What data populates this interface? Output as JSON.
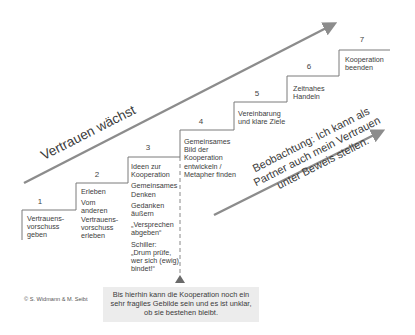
{
  "diagram": {
    "main_arrow": {
      "label": "Vertrauen wächst",
      "from": [
        24,
        183
      ],
      "to": [
        338,
        22
      ],
      "color": "#8c8c8c"
    },
    "observation_arrow": {
      "lines": [
        "Beobachtung: Ich kann als",
        "Partner auch mein Vertrauen",
        "unter Beweis stellen."
      ],
      "from": [
        214,
        215
      ],
      "to": [
        386,
        129
      ],
      "color": "#8c8c8c"
    },
    "steps": [
      {
        "number": "1",
        "items": [
          "Vertrauens-\nvorschuss\ngeben"
        ]
      },
      {
        "number": "2",
        "items": [
          "Erleben",
          "Vom\nanderen\nVertrauens-\nvorschuss\nerleben"
        ]
      },
      {
        "number": "3",
        "items": [
          "Ideen zur\nKooperation",
          "Gemeinsames\nDenken",
          "Gedanken\näußern",
          "„Versprechen\nabgeben“",
          "Schiller:\n„Drum prüfe,\nwer sich (ewig)\nbindet!“"
        ]
      },
      {
        "number": "4",
        "items": [
          "Gemeinsames\nBild der\nKooperation\nentwickeln /\nMetapher finden"
        ]
      },
      {
        "number": "5",
        "items": [
          "Vereinbarung\nund klare Ziele"
        ]
      },
      {
        "number": "6",
        "items": [
          "Zeitnahes\nHandeln"
        ]
      },
      {
        "number": "7",
        "items": [
          "Kooperation\nbeenden"
        ]
      }
    ],
    "note": "Bis hierhin kann die Kooperation noch ein sehr fragiles Gebilde sein und es ist unklar, ob sie bestehen bleibt.",
    "note_lines": [
      "Bis hierhin kann die Kooperation noch ein",
      "sehr fragiles Gebilde sein und es ist unklar,",
      "ob sie bestehen bleibt."
    ],
    "copyright": "© S. Widmann & M. Seibt",
    "colors": {
      "line": "#7a7a7a",
      "arrow": "#8c8c8c",
      "note_bg": "#ececec",
      "text": "#3a3a3a"
    }
  }
}
